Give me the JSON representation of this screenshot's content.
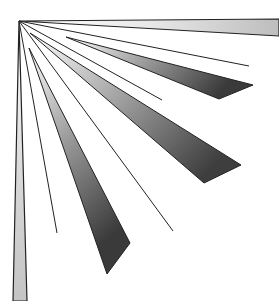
{
  "graphic": {
    "description": "Radiating rays and wedge bands emanating from the top-left corner",
    "origin": [
      19,
      21
    ],
    "colors": {
      "background": "#ffffff",
      "stroke": "#222222",
      "band_light": "#f2f2f2",
      "band_mid": "#c8c8c8",
      "band_dark": "#555555"
    },
    "bands": [
      {
        "name": "top-band",
        "points": [
          [
            19,
            21
          ],
          [
            279,
            19
          ],
          [
            279,
            36
          ]
        ]
      },
      {
        "name": "left-band",
        "points": [
          [
            19,
            21
          ],
          [
            13,
            301
          ],
          [
            27,
            301
          ]
        ]
      },
      {
        "name": "wedge-1",
        "points": [
          [
            66,
            37
          ],
          [
            253,
            85
          ],
          [
            219,
            99
          ]
        ]
      },
      {
        "name": "wedge-2",
        "points": [
          [
            30,
            33
          ],
          [
            241,
            165
          ],
          [
            204,
            183
          ]
        ]
      },
      {
        "name": "wedge-3",
        "points": [
          [
            29,
            48
          ],
          [
            130,
            243
          ],
          [
            107,
            274
          ]
        ]
      }
    ],
    "lines": [
      {
        "name": "ray-1",
        "to": [
          249,
          66
        ]
      },
      {
        "name": "ray-2",
        "to": [
          162,
          100
        ]
      },
      {
        "name": "ray-3",
        "to": [
          173,
          231
        ]
      },
      {
        "name": "ray-4",
        "to": [
          57,
          233
        ]
      }
    ]
  }
}
